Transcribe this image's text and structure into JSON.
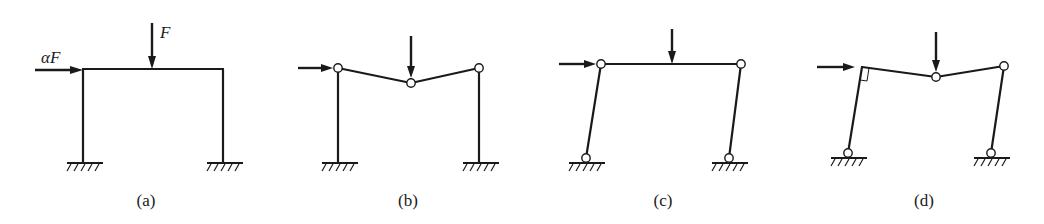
{
  "figure": {
    "panels": [
      {
        "id": "a",
        "caption": "(a)",
        "description": "Portal frame with fixed supports and rigid joints",
        "loads": {
          "vertical": "F",
          "horizontal": "αF"
        }
      },
      {
        "id": "b",
        "caption": "(b)",
        "description": "Frame with fixed column bases, hinges at column tops and mid-beam (collapse mechanism)"
      },
      {
        "id": "c",
        "caption": "(c)",
        "description": "Frame with pinned supports and hinges at column tops (sway mechanism)"
      },
      {
        "id": "d",
        "caption": "(d)",
        "description": "Frame with pinned supports, rigid left corner (right-angle), hinges at mid-beam and right column top (combined mechanism)"
      }
    ],
    "labels": {
      "vertical_load": "F",
      "horizontal_load": "αF"
    },
    "colors": {
      "line": "#1a1a1a",
      "background": "#ffffff"
    }
  }
}
